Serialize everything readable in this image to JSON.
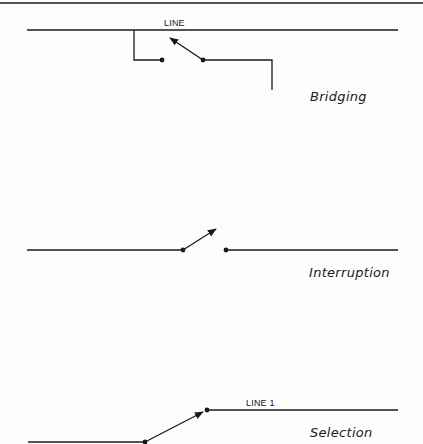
{
  "figure": {
    "colors": {
      "ink": "#1a1a1a",
      "paper": "#fdfdfd"
    },
    "panels": [
      {
        "id": "bridging",
        "caption": "Bridging",
        "line_label": "LINE"
      },
      {
        "id": "interruption",
        "caption": "Interruption"
      },
      {
        "id": "selection",
        "caption": "Selection",
        "line_label": "LINE 1"
      }
    ]
  }
}
